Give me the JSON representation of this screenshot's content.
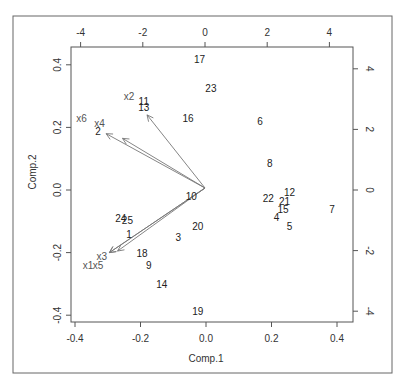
{
  "chart_data": {
    "type": "scatter",
    "subtype": "biplot",
    "title": "",
    "xlabel": "Comp.1",
    "ylabel": "Comp.2",
    "xlim": [
      -0.42,
      0.45
    ],
    "ylim": [
      -0.42,
      0.46
    ],
    "grid": false,
    "bottom_ticks": [
      "-0.4",
      "-0.2",
      "0.0",
      "0.2",
      "0.4"
    ],
    "left_ticks": [
      "-0.4",
      "-0.2",
      "0.0",
      "0.2",
      "0.4"
    ],
    "top_ticks": [
      "-4",
      "-2",
      "0",
      "2",
      "4"
    ],
    "right_ticks": [
      "-4",
      "-2",
      "0",
      "2",
      "4"
    ],
    "observations": [
      {
        "label": "1",
        "x": -0.235,
        "y": -0.14
      },
      {
        "label": "2",
        "x": -0.33,
        "y": 0.19
      },
      {
        "label": "3",
        "x": -0.085,
        "y": -0.15
      },
      {
        "label": "4",
        "x": 0.215,
        "y": -0.085
      },
      {
        "label": "5",
        "x": 0.255,
        "y": -0.115
      },
      {
        "label": "6",
        "x": 0.165,
        "y": 0.22
      },
      {
        "label": "7",
        "x": 0.385,
        "y": -0.06
      },
      {
        "label": "8",
        "x": 0.195,
        "y": 0.085
      },
      {
        "label": "9",
        "x": -0.175,
        "y": -0.24
      },
      {
        "label": "10",
        "x": -0.045,
        "y": -0.02
      },
      {
        "label": "11",
        "x": -0.19,
        "y": 0.285
      },
      {
        "label": "12",
        "x": 0.255,
        "y": -0.005
      },
      {
        "label": "13",
        "x": -0.19,
        "y": 0.265
      },
      {
        "label": "14",
        "x": -0.135,
        "y": -0.3
      },
      {
        "label": "15",
        "x": 0.235,
        "y": -0.06
      },
      {
        "label": "16",
        "x": -0.055,
        "y": 0.23
      },
      {
        "label": "17",
        "x": -0.02,
        "y": 0.42
      },
      {
        "label": "18",
        "x": -0.195,
        "y": -0.2
      },
      {
        "label": "19",
        "x": -0.025,
        "y": -0.385
      },
      {
        "label": "20",
        "x": -0.025,
        "y": -0.115
      },
      {
        "label": "21",
        "x": 0.24,
        "y": -0.035
      },
      {
        "label": "22",
        "x": 0.19,
        "y": -0.025
      },
      {
        "label": "23",
        "x": 0.015,
        "y": 0.325
      },
      {
        "label": "24",
        "x": -0.26,
        "y": -0.09
      },
      {
        "label": "25",
        "x": -0.24,
        "y": -0.095
      }
    ],
    "loadings": [
      {
        "label": "x1",
        "tip_x": -0.295,
        "tip_y": -0.2,
        "label_x": -0.36,
        "label_y": -0.24
      },
      {
        "label": "x2",
        "tip_x": -0.18,
        "tip_y": 0.24,
        "label_x": -0.235,
        "label_y": 0.3
      },
      {
        "label": "x3",
        "tip_x": -0.295,
        "tip_y": -0.2,
        "label_x": -0.318,
        "label_y": -0.21
      },
      {
        "label": "x4",
        "tip_x": -0.305,
        "tip_y": 0.18,
        "label_x": -0.325,
        "label_y": 0.215
      },
      {
        "label": "x5",
        "tip_x": -0.27,
        "tip_y": -0.195,
        "label_x": -0.33,
        "label_y": -0.24
      },
      {
        "label": "x6",
        "tip_x": -0.255,
        "tip_y": 0.165,
        "label_x": -0.38,
        "label_y": 0.23
      }
    ]
  }
}
